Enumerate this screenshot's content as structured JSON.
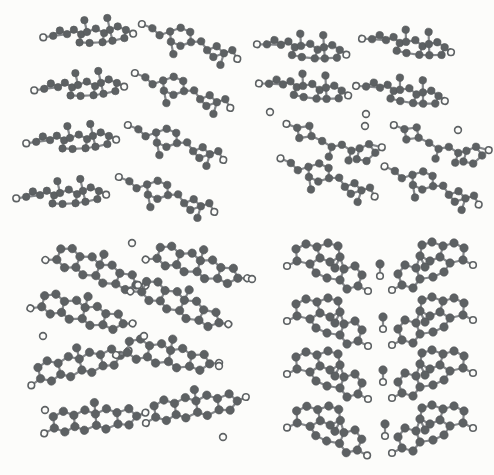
{
  "figure": {
    "kind": "crystal-packing-diagram",
    "width": 494,
    "height": 475,
    "colors": {
      "background": "#fcfcfa",
      "atom_fill": "#5d6163",
      "atom_edge": "#55585a",
      "bond_stroke": "#84878a",
      "open_fill": "#fcfcfa",
      "open_stroke": "#5d6163"
    },
    "bond_width": 2.2,
    "open_r": 3.3,
    "open_stroke_width": 1.6,
    "water_r": 3.4
  },
  "templates": {
    "edgeA": {
      "r": 3.7,
      "center": [
        45,
        12
      ],
      "atoms": [
        [
          0,
          15,
          "o"
        ],
        [
          10,
          14,
          "f"
        ],
        [
          17,
          9,
          "f"
        ],
        [
          24,
          13,
          "f"
        ],
        [
          31,
          9,
          "f"
        ],
        [
          38,
          14,
          "f"
        ],
        [
          36,
          22,
          "f"
        ],
        [
          46,
          23,
          "f"
        ],
        [
          44,
          12,
          "f"
        ],
        [
          42,
          0,
          "f"
        ],
        [
          53,
          9,
          "f"
        ],
        [
          61,
          14,
          "f"
        ],
        [
          59,
          23,
          "f"
        ],
        [
          69,
          22,
          "f"
        ],
        [
          67,
          11,
          "f"
        ],
        [
          65,
          -1,
          "f"
        ],
        [
          75,
          8,
          "f"
        ],
        [
          83,
          12,
          "f"
        ],
        [
          81,
          20,
          "f"
        ],
        [
          90,
          16,
          "o"
        ]
      ],
      "bonds": [
        [
          0,
          1
        ],
        [
          1,
          2
        ],
        [
          2,
          3
        ],
        [
          3,
          4
        ],
        [
          4,
          5
        ],
        [
          5,
          6
        ],
        [
          6,
          7
        ],
        [
          5,
          8
        ],
        [
          8,
          9
        ],
        [
          7,
          12
        ],
        [
          8,
          10
        ],
        [
          10,
          11
        ],
        [
          11,
          12
        ],
        [
          11,
          14
        ],
        [
          12,
          13
        ],
        [
          13,
          14
        ],
        [
          14,
          15
        ],
        [
          14,
          16
        ],
        [
          16,
          17
        ],
        [
          17,
          18
        ],
        [
          13,
          18
        ],
        [
          17,
          19
        ],
        [
          1,
          3
        ]
      ]
    },
    "edgeB": {
      "r": 3.7,
      "center": [
        50,
        18
      ],
      "atoms": [
        [
          0,
          6,
          "o"
        ],
        [
          11,
          9,
          "f"
        ],
        [
          19,
          15,
          "f"
        ],
        [
          29,
          10,
          "f"
        ],
        [
          39,
          5,
          "f"
        ],
        [
          49,
          8,
          "f"
        ],
        [
          51,
          18,
          "f"
        ],
        [
          41,
          23,
          "f"
        ],
        [
          31,
          20,
          "f"
        ],
        [
          35,
          32,
          "f"
        ],
        [
          61,
          16,
          "f"
        ],
        [
          68,
          24,
          "f"
        ],
        [
          77,
          19,
          "f"
        ],
        [
          75,
          30,
          "f"
        ],
        [
          85,
          25,
          "f"
        ],
        [
          83,
          37,
          "f"
        ],
        [
          93,
          21,
          "f"
        ],
        [
          99,
          29,
          "o"
        ]
      ],
      "bonds": [
        [
          0,
          1
        ],
        [
          1,
          2
        ],
        [
          2,
          3
        ],
        [
          3,
          4
        ],
        [
          4,
          5
        ],
        [
          5,
          6
        ],
        [
          6,
          7
        ],
        [
          7,
          8
        ],
        [
          8,
          3
        ],
        [
          8,
          9
        ],
        [
          6,
          10
        ],
        [
          10,
          11
        ],
        [
          11,
          12
        ],
        [
          11,
          13
        ],
        [
          12,
          14
        ],
        [
          13,
          14
        ],
        [
          14,
          15
        ],
        [
          14,
          16
        ],
        [
          16,
          17
        ]
      ]
    },
    "edgeC": {
      "r": 3.7,
      "center": [
        48,
        18
      ],
      "atoms": [
        [
          0,
          3,
          "o"
        ],
        [
          11,
          6,
          "f"
        ],
        [
          23,
          3,
          "f"
        ],
        [
          26,
          13,
          "f"
        ],
        [
          14,
          16,
          "f"
        ],
        [
          37,
          17,
          "f"
        ],
        [
          47,
          22,
          "f"
        ],
        [
          45,
          32,
          "f"
        ],
        [
          57,
          19,
          "f"
        ],
        [
          67,
          24,
          "f"
        ],
        [
          65,
          34,
          "f"
        ],
        [
          75,
          21,
          "f"
        ],
        [
          84,
          16,
          "f"
        ],
        [
          91,
          24,
          "f"
        ],
        [
          83,
          33,
          "f"
        ],
        [
          73,
          32,
          "f"
        ],
        [
          97,
          18,
          "o"
        ]
      ],
      "bonds": [
        [
          0,
          1
        ],
        [
          1,
          2
        ],
        [
          2,
          3
        ],
        [
          3,
          4
        ],
        [
          4,
          1
        ],
        [
          3,
          5
        ],
        [
          5,
          6
        ],
        [
          6,
          7
        ],
        [
          6,
          8
        ],
        [
          8,
          9
        ],
        [
          9,
          10
        ],
        [
          9,
          11
        ],
        [
          11,
          12
        ],
        [
          12,
          13
        ],
        [
          13,
          14
        ],
        [
          14,
          15
        ],
        [
          15,
          11
        ],
        [
          12,
          16
        ]
      ]
    },
    "faceA": {
      "r": 4.2,
      "center": [
        48,
        24
      ],
      "atoms": [
        [
          0,
          44,
          "o"
        ],
        [
          9,
          37,
          "f"
        ],
        [
          6,
          26,
          "f"
        ],
        [
          15,
          19,
          "f"
        ],
        [
          26,
          21,
          "f"
        ],
        [
          29,
          32,
          "f"
        ],
        [
          20,
          39,
          "f"
        ],
        [
          36,
          14,
          "f"
        ],
        [
          47,
          16,
          "f"
        ],
        [
          50,
          27,
          "f"
        ],
        [
          39,
          34,
          "f"
        ],
        [
          57,
          9,
          "f"
        ],
        [
          68,
          11,
          "f"
        ],
        [
          71,
          22,
          "f"
        ],
        [
          60,
          29,
          "f"
        ],
        [
          79,
          5,
          "f"
        ],
        [
          88,
          11,
          "f"
        ],
        [
          82,
          21,
          "f"
        ],
        [
          96,
          6,
          "o"
        ],
        [
          44,
          5,
          "f"
        ]
      ],
      "bonds": [
        [
          0,
          1
        ],
        [
          1,
          2
        ],
        [
          2,
          3
        ],
        [
          3,
          4
        ],
        [
          4,
          5
        ],
        [
          5,
          6
        ],
        [
          6,
          1
        ],
        [
          4,
          7
        ],
        [
          7,
          8
        ],
        [
          8,
          9
        ],
        [
          9,
          10
        ],
        [
          10,
          5
        ],
        [
          8,
          11
        ],
        [
          11,
          12
        ],
        [
          12,
          13
        ],
        [
          13,
          14
        ],
        [
          14,
          9
        ],
        [
          12,
          15
        ],
        [
          15,
          16
        ],
        [
          16,
          17
        ],
        [
          17,
          13
        ],
        [
          16,
          18
        ],
        [
          8,
          19
        ]
      ]
    },
    "faceB": {
      "r": 4.2,
      "center": [
        40,
        25
      ],
      "atoms": [
        [
          0,
          24,
          "o"
        ],
        [
          10,
          19,
          "f"
        ],
        [
          9,
          7,
          "f"
        ],
        [
          19,
          2,
          "f"
        ],
        [
          30,
          5,
          "f"
        ],
        [
          33,
          16,
          "f"
        ],
        [
          23,
          22,
          "f"
        ],
        [
          41,
          1,
          "f"
        ],
        [
          51,
          4,
          "f"
        ],
        [
          53,
          15,
          "f"
        ],
        [
          43,
          20,
          "f"
        ],
        [
          57,
          27,
          "f"
        ],
        [
          68,
          24,
          "f"
        ],
        [
          75,
          33,
          "f"
        ],
        [
          71,
          44,
          "f"
        ],
        [
          60,
          47,
          "f"
        ],
        [
          53,
          38,
          "f"
        ],
        [
          81,
          49,
          "o"
        ],
        [
          29,
          31,
          "f"
        ],
        [
          40,
          36,
          "f"
        ],
        [
          48,
          26,
          "f"
        ]
      ],
      "bonds": [
        [
          0,
          1
        ],
        [
          1,
          2
        ],
        [
          2,
          3
        ],
        [
          3,
          4
        ],
        [
          4,
          5
        ],
        [
          5,
          6
        ],
        [
          6,
          1
        ],
        [
          4,
          7
        ],
        [
          7,
          8
        ],
        [
          8,
          9
        ],
        [
          9,
          10
        ],
        [
          10,
          5
        ],
        [
          9,
          11
        ],
        [
          11,
          12
        ],
        [
          12,
          13
        ],
        [
          13,
          14
        ],
        [
          14,
          15
        ],
        [
          15,
          16
        ],
        [
          16,
          11
        ],
        [
          14,
          17
        ],
        [
          6,
          18
        ],
        [
          18,
          19
        ],
        [
          19,
          16
        ],
        [
          9,
          20
        ]
      ]
    },
    "solvent": {
      "r": 4.2,
      "center": [
        0,
        6
      ],
      "atoms": [
        [
          0,
          0,
          "f"
        ],
        [
          0,
          12,
          "o"
        ]
      ],
      "bonds": [
        [
          0,
          1
        ]
      ]
    }
  },
  "panels": [
    {
      "id": "top-left",
      "molecules": [
        {
          "t": "edgeA",
          "x": 43,
          "y": 20,
          "rot": -3
        },
        {
          "t": "edgeB",
          "x": 140,
          "y": 24,
          "rot": 7
        },
        {
          "t": "edgeA",
          "x": 34,
          "y": 73,
          "rot": -3
        },
        {
          "t": "edgeB",
          "x": 133,
          "y": 73,
          "rot": 7
        },
        {
          "t": "edgeA",
          "x": 26,
          "y": 126,
          "rot": -3
        },
        {
          "t": "edgeB",
          "x": 126,
          "y": 125,
          "rot": 7
        },
        {
          "t": "edgeA",
          "x": 16,
          "y": 181,
          "rot": -3
        },
        {
          "t": "edgeB",
          "x": 117,
          "y": 177,
          "rot": 7
        }
      ],
      "waters": []
    },
    {
      "id": "top-right",
      "molecules": [
        {
          "t": "edgeA",
          "x": 257,
          "y": 34,
          "rot": 6
        },
        {
          "t": "edgeA",
          "x": 362,
          "y": 30,
          "rot": 8
        },
        {
          "t": "edgeA",
          "x": 259,
          "y": 74,
          "rot": 7
        },
        {
          "t": "edgeA",
          "x": 356,
          "y": 78,
          "rot": 9
        },
        {
          "t": "edgeC",
          "x": 285,
          "y": 125,
          "rot": 5
        },
        {
          "t": "edgeC",
          "x": 392,
          "y": 127,
          "rot": 6
        },
        {
          "t": "edgeB",
          "x": 278,
          "y": 160,
          "rot": 9
        },
        {
          "t": "edgeB",
          "x": 382,
          "y": 168,
          "rot": 9
        }
      ],
      "waters": [
        [
          270,
          112
        ],
        [
          366,
          114
        ],
        [
          365,
          126
        ],
        [
          458,
          130
        ]
      ]
    },
    {
      "id": "bottom-left",
      "molecules": [
        {
          "t": "faceA",
          "x": 48,
          "y": 248,
          "rot": 36
        },
        {
          "t": "faceA",
          "x": 149,
          "y": 244,
          "rot": 32
        },
        {
          "t": "faceA",
          "x": 34,
          "y": 291,
          "rot": 30
        },
        {
          "t": "faceA",
          "x": 132,
          "y": 283,
          "rot": 40
        },
        {
          "t": "faceA",
          "x": 32,
          "y": 343,
          "rot": 2
        },
        {
          "t": "faceA",
          "x": 120,
          "y": 334,
          "rot": 26
        },
        {
          "t": "faceA",
          "x": 47,
          "y": 398,
          "rot": 10
        },
        {
          "t": "faceA",
          "x": 148,
          "y": 385,
          "rot": 7
        }
      ],
      "waters": [
        [
          132,
          243
        ],
        [
          138,
          285
        ],
        [
          43,
          336
        ],
        [
          144,
          336
        ],
        [
          219,
          366
        ],
        [
          45,
          410
        ],
        [
          223,
          437
        ]
      ]
    },
    {
      "id": "bottom-right",
      "molecules": [
        {
          "t": "faceB",
          "x": 287,
          "y": 242,
          "rot": 0
        },
        {
          "t": "faceB",
          "x": 473,
          "y": 241,
          "rot": 0,
          "sx": -1
        },
        {
          "t": "faceB",
          "x": 287,
          "y": 297,
          "rot": 0
        },
        {
          "t": "faceB",
          "x": 473,
          "y": 296,
          "rot": 0,
          "sx": -1
        },
        {
          "t": "faceB",
          "x": 287,
          "y": 350,
          "rot": 0
        },
        {
          "t": "faceB",
          "x": 473,
          "y": 349,
          "rot": 0,
          "sx": -1
        },
        {
          "t": "faceB",
          "x": 287,
          "y": 405,
          "rot": 2
        },
        {
          "t": "faceB",
          "x": 473,
          "y": 404,
          "rot": 0,
          "sx": -1
        },
        {
          "t": "solvent",
          "x": 380,
          "y": 264,
          "rot": 0
        },
        {
          "t": "solvent",
          "x": 383,
          "y": 317,
          "rot": 0
        },
        {
          "t": "solvent",
          "x": 383,
          "y": 370,
          "rot": 0
        },
        {
          "t": "solvent",
          "x": 385,
          "y": 424,
          "rot": 0
        }
      ],
      "waters": [
        [
          252,
          279
        ]
      ]
    }
  ]
}
